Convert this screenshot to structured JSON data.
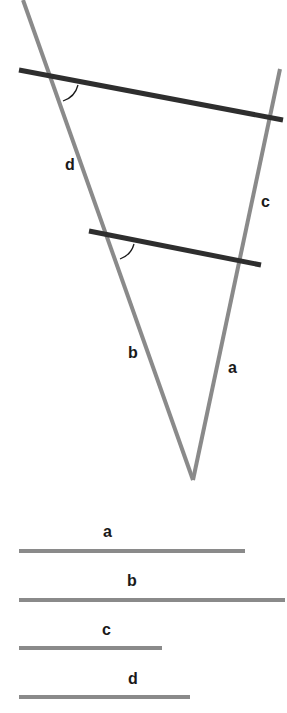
{
  "diagram": {
    "type": "geometry-intercept-theorem",
    "colors": {
      "triangle_lines": "#8a8a8a",
      "parallel_lines": "#2e2e2e",
      "angle_arc": "#1a1a1a",
      "labels": "#1a1a1a",
      "segments": "#8a8a8a",
      "background": "#ffffff"
    },
    "figure": {
      "apex": [
        193,
        480
      ],
      "left_line": {
        "from": [
          23,
          0
        ],
        "to": [
          193,
          480
        ]
      },
      "right_line": {
        "from": [
          280,
          69
        ],
        "to": [
          193,
          480
        ]
      },
      "parallel_lines": [
        {
          "name": "upper",
          "from": [
            19,
            70
          ],
          "to": [
            283,
            120
          ]
        },
        {
          "name": "lower",
          "from": [
            89,
            231
          ],
          "to": [
            261,
            265
          ]
        }
      ],
      "side_labels": [
        {
          "text": "d",
          "x": 69,
          "y": 170
        },
        {
          "text": "c",
          "x": 265,
          "y": 207
        },
        {
          "text": "b",
          "x": 132,
          "y": 358
        },
        {
          "text": "a",
          "x": 232,
          "y": 373
        }
      ]
    },
    "segments": [
      {
        "label": "a",
        "x1": 19,
        "x2": 245,
        "y": 551,
        "label_x": 107,
        "label_y": 537
      },
      {
        "label": "b",
        "x1": 19,
        "x2": 285,
        "y": 600,
        "label_x": 131,
        "label_y": 586
      },
      {
        "label": "c",
        "x1": 19,
        "x2": 162,
        "y": 648,
        "label_x": 106,
        "label_y": 635
      },
      {
        "label": "d",
        "x1": 19,
        "x2": 190,
        "y": 697,
        "label_x": 132,
        "label_y": 684
      }
    ]
  }
}
